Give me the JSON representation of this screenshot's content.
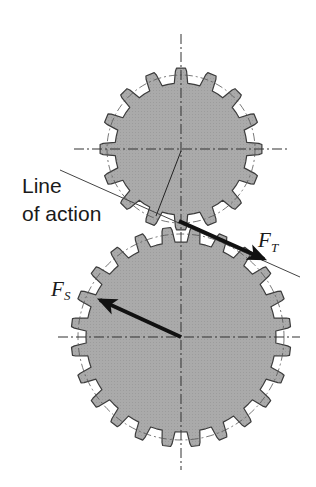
{
  "diagram": {
    "type": "spur-gear-mesh-forces",
    "colors": {
      "background": "#ffffff",
      "gear_fill": "#a9a9a9",
      "gear_outline": "#3c3c3c",
      "centerline": "#333333",
      "pitch_circle": "#555555",
      "arrow": "#111111",
      "text": "#1a1a1a"
    },
    "gears": [
      {
        "name": "upper-gear",
        "cx": 181,
        "cy": 149,
        "teeth": 16,
        "outer_r": 81,
        "root_r": 66,
        "pitch_r": 74,
        "phase_deg": 0
      },
      {
        "name": "lower-gear",
        "cx": 181,
        "cy": 337,
        "teeth": 24,
        "outer_r": 110,
        "root_r": 95,
        "pitch_r": 103,
        "phase_deg": 7.5
      }
    ],
    "centerlines": {
      "vertical": {
        "x": 181,
        "y1": 34,
        "y2": 470
      },
      "upper_horizontal": {
        "y": 149,
        "x1": 74,
        "x2": 288
      },
      "lower_horizontal": {
        "y": 337,
        "x1": 58,
        "x2": 300
      }
    },
    "line_of_action": {
      "x1": 60,
      "y1": 170,
      "x2": 300,
      "y2": 277,
      "label_line1": "Line",
      "label_line2": "of action"
    },
    "radius_line": {
      "x1": 181,
      "y1": 151,
      "x2": 156,
      "y2": 216
    },
    "forces": [
      {
        "name": "F_T",
        "symbol": "F",
        "subscript": "T",
        "x1": 179,
        "y1": 221,
        "x2": 264,
        "y2": 259
      },
      {
        "name": "F_S",
        "symbol": "F",
        "subscript": "S",
        "x1": 181,
        "y1": 337,
        "x2": 100,
        "y2": 300
      }
    ]
  }
}
